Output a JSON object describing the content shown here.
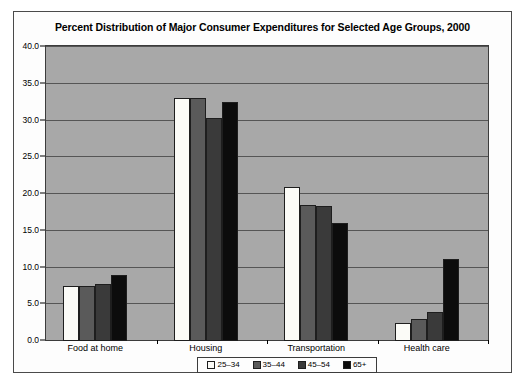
{
  "chart_data": {
    "type": "bar",
    "title": "Percent Distribution of Major Consumer Expenditures for Selected Age Groups, 2000",
    "xlabel": "",
    "ylabel": "",
    "ylim": [
      0,
      40
    ],
    "ytick_step": 5,
    "grid": true,
    "legend_position": "bottom",
    "categories": [
      "Food at home",
      "Housing",
      "Transportation",
      "Health care"
    ],
    "ytick_labels": [
      "0.0",
      "5.0",
      "10.0",
      "15.0",
      "20.0",
      "25.0",
      "30.0",
      "35.0",
      "40.0"
    ],
    "series": [
      {
        "name": "25–34",
        "color": "#fbfbf7",
        "values": [
          7.5,
          33.0,
          20.9,
          2.4
        ]
      },
      {
        "name": "35–44",
        "color": "#5a5a5a",
        "values": [
          7.5,
          33.0,
          18.5,
          3.0
        ]
      },
      {
        "name": "45–54",
        "color": "#3a3a3a",
        "values": [
          7.7,
          30.3,
          18.4,
          4.0
        ]
      },
      {
        "name": "65+",
        "color": "#0c0c0c",
        "values": [
          9.0,
          32.5,
          16.0,
          11.1
        ]
      }
    ],
    "plot_background": "#a8a8a8",
    "gridline_color": "#555555",
    "figure_background": "#fdfdfd"
  }
}
